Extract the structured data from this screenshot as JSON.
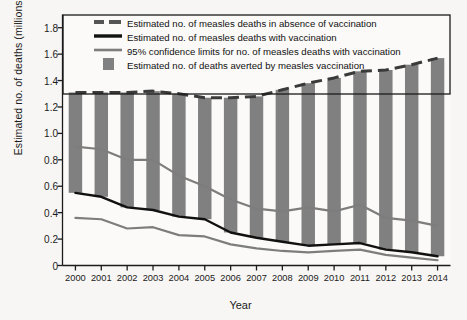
{
  "chart_data": {
    "type": "area",
    "title": "",
    "xlabel": "Year",
    "ylabel": "Estimated no. of deaths (millions)",
    "xlim": [
      2000,
      2014
    ],
    "ylim": [
      0,
      1.9
    ],
    "yticks": [
      "0",
      "0.2",
      "0.4",
      "0.6",
      "0.8",
      "1.0",
      "1.2",
      "1.4",
      "1.6",
      "1.8"
    ],
    "ytick_values": [
      0,
      0.2,
      0.4,
      0.6,
      0.8,
      1.0,
      1.2,
      1.4,
      1.6,
      1.8
    ],
    "categories": [
      2000,
      2001,
      2002,
      2003,
      2004,
      2005,
      2006,
      2007,
      2008,
      2009,
      2010,
      2011,
      2012,
      2013,
      2014
    ],
    "xtick_labels": [
      "2000",
      "2001",
      "2002",
      "2003",
      "2004",
      "2005",
      "2006",
      "2007",
      "2008",
      "2009",
      "2010",
      "2011",
      "2012",
      "2013",
      "2014"
    ],
    "grid": false,
    "legend_position": "top-left-inside",
    "series": [
      {
        "name": "Estimated no. of measles deaths in absence of vaccination",
        "key": "no_vaccination",
        "style": "dashed",
        "color": "#3a3a3a",
        "values": [
          1.31,
          1.31,
          1.31,
          1.32,
          1.3,
          1.27,
          1.27,
          1.28,
          1.33,
          1.38,
          1.42,
          1.47,
          1.48,
          1.52,
          1.57
        ]
      },
      {
        "name": "Estimated no. of measles deaths with vaccination",
        "key": "with_vaccination",
        "style": "solid-black",
        "color": "#111111",
        "values": [
          0.55,
          0.52,
          0.44,
          0.42,
          0.37,
          0.35,
          0.25,
          0.21,
          0.18,
          0.15,
          0.16,
          0.17,
          0.12,
          0.1,
          0.07
        ]
      },
      {
        "name": "95% confidence limits for no. of measles deaths with vaccination (upper)",
        "key": "ci_upper",
        "style": "solid-gray",
        "color": "#7d7d7d",
        "values": [
          0.9,
          0.88,
          0.8,
          0.8,
          0.68,
          0.6,
          0.5,
          0.43,
          0.41,
          0.44,
          0.41,
          0.46,
          0.36,
          0.34,
          0.3
        ]
      },
      {
        "name": "95% confidence limits for no. of measles deaths with vaccination (lower)",
        "key": "ci_lower",
        "style": "solid-gray",
        "color": "#7d7d7d",
        "values": [
          0.36,
          0.35,
          0.28,
          0.29,
          0.23,
          0.22,
          0.16,
          0.13,
          0.11,
          0.1,
          0.11,
          0.12,
          0.08,
          0.06,
          0.04
        ]
      },
      {
        "name": "Estimated no. of deaths averted by measles vaccination",
        "key": "averted",
        "style": "bar",
        "color": "#808080",
        "values": [
          0.76,
          0.79,
          0.87,
          0.9,
          0.93,
          0.92,
          1.02,
          1.07,
          1.15,
          1.23,
          1.26,
          1.3,
          1.36,
          1.42,
          1.5
        ]
      }
    ],
    "legend": [
      {
        "label": "Estimated no. of measles deaths in absence of vaccination",
        "marker": "dashed-gray"
      },
      {
        "label": "Estimated no. of measles deaths with vaccination",
        "marker": "solid-black"
      },
      {
        "label": "95% confidence limits for no. of measles deaths with vaccination",
        "marker": "solid-gray"
      },
      {
        "label": "Estimated no. of deaths averted by measles vaccination",
        "marker": "gray-swatch"
      }
    ]
  },
  "colors": {
    "bar": "#808080",
    "dashed_line": "#3a3a3a",
    "black_line": "#111111",
    "gray_line": "#7d7d7d",
    "axis": "#1b1b1b",
    "background": "#f7f6f4"
  }
}
